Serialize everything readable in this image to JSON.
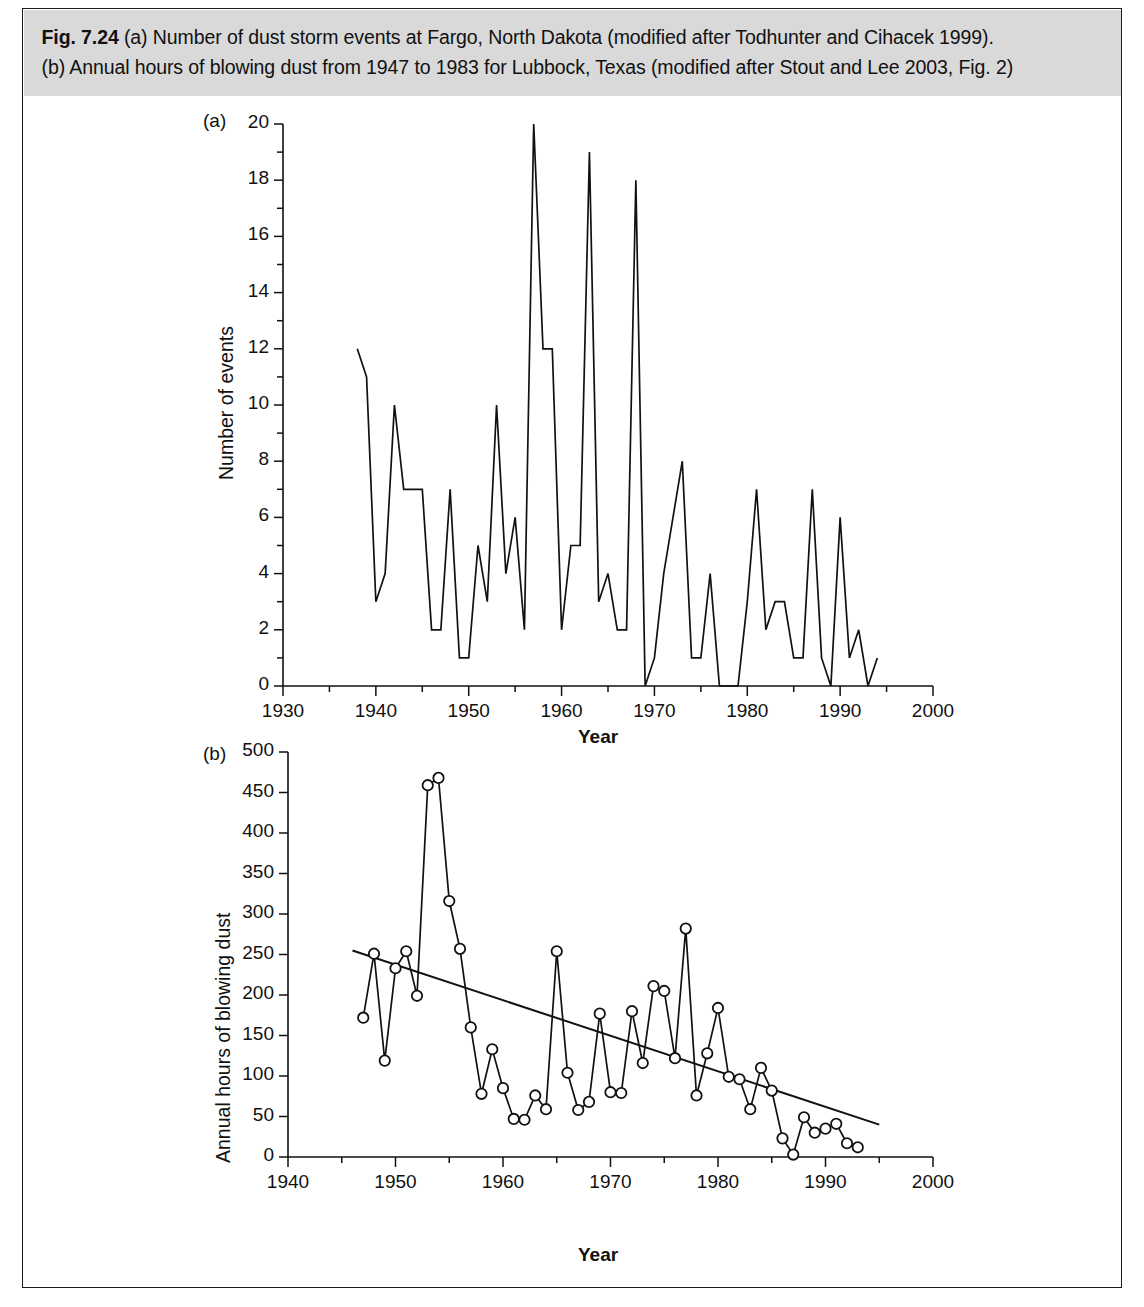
{
  "figure": {
    "label": "Fig. 7.24",
    "caption_line1": "(a) Number of dust storm events at Fargo, North Dakota (modified after Todhunter and Cihacek 1999).",
    "caption_line2": "(b) Annual hours of blowing dust from 1947 to 1983 for Lubbock, Texas (modified after Stout and Lee 2003, Fig. 2)",
    "background": "#d9d9d9",
    "ink": "#111111"
  },
  "panel_a": {
    "tag": "(a)",
    "xlabel": "Year",
    "ylabel": "Number of events",
    "x_ticklabels": [
      "1930",
      "1940",
      "1950",
      "1960",
      "1970",
      "1980",
      "1990",
      "2000"
    ],
    "y_ticklabels": [
      "0",
      "2",
      "4",
      "6",
      "8",
      "10",
      "12",
      "14",
      "16",
      "18",
      "20"
    ]
  },
  "panel_b": {
    "tag": "(b)",
    "xlabel": "Year",
    "ylabel": "Annual hours of blowing dust",
    "x_ticklabels": [
      "1940",
      "1950",
      "1960",
      "1970",
      "1980",
      "1990",
      "2000"
    ],
    "y_ticklabels": [
      "0",
      "50",
      "100",
      "150",
      "200",
      "250",
      "300",
      "350",
      "400",
      "450",
      "500"
    ]
  },
  "chart_data": [
    {
      "id": "panel-a",
      "type": "line",
      "title": "(a) Number of dust storm events at Fargo, North Dakota",
      "xlabel": "Year",
      "ylabel": "Number of events",
      "xlim": [
        1930,
        2000
      ],
      "ylim": [
        0,
        20
      ],
      "xticks": [
        1930,
        1940,
        1950,
        1960,
        1970,
        1980,
        1990,
        2000
      ],
      "xminorticks": [
        1935,
        1945,
        1955,
        1965,
        1975,
        1985,
        1995
      ],
      "yticks": [
        0,
        2,
        4,
        6,
        8,
        10,
        12,
        14,
        16,
        18,
        20
      ],
      "yminorticks": [
        1,
        3,
        5,
        7,
        9,
        11,
        13,
        15,
        17,
        19
      ],
      "grid": false,
      "legend": false,
      "markers": false,
      "x": [
        1938,
        1939,
        1940,
        1941,
        1942,
        1943,
        1944,
        1945,
        1946,
        1947,
        1948,
        1949,
        1950,
        1951,
        1952,
        1953,
        1954,
        1955,
        1956,
        1957,
        1958,
        1959,
        1960,
        1961,
        1962,
        1963,
        1964,
        1965,
        1966,
        1967,
        1968,
        1969,
        1970,
        1971,
        1972,
        1973,
        1974,
        1975,
        1976,
        1977,
        1978,
        1979,
        1980,
        1981,
        1982,
        1983,
        1984,
        1985,
        1986,
        1987,
        1988,
        1989,
        1990,
        1991,
        1992,
        1993,
        1994
      ],
      "y": [
        12,
        11,
        3,
        4,
        10,
        7,
        7,
        7,
        2,
        2,
        7,
        1,
        1,
        5,
        3,
        10,
        4,
        6,
        2,
        20,
        12,
        12,
        2,
        5,
        5,
        19,
        3,
        4,
        2,
        2,
        18,
        0,
        1,
        4,
        6,
        8,
        1,
        1,
        4,
        0,
        0,
        0,
        3,
        7,
        2,
        3,
        3,
        1,
        1,
        7,
        1,
        0,
        6,
        1,
        2,
        0,
        1
      ]
    },
    {
      "id": "panel-b",
      "type": "scatter",
      "title": "(b) Annual hours of blowing dust, Lubbock, Texas",
      "xlabel": "Year",
      "ylabel": "Annual hours of blowing dust",
      "xlim": [
        1940,
        2000
      ],
      "ylim": [
        0,
        500
      ],
      "xticks": [
        1940,
        1950,
        1960,
        1970,
        1980,
        1990,
        2000
      ],
      "xminorticks": [
        1945,
        1955,
        1965,
        1975,
        1985,
        1995
      ],
      "yticks": [
        0,
        50,
        100,
        150,
        200,
        250,
        300,
        350,
        400,
        450,
        500
      ],
      "grid": false,
      "legend": false,
      "markers": true,
      "marker_style": "open-circle",
      "connected": true,
      "x": [
        1947,
        1948,
        1949,
        1950,
        1951,
        1952,
        1953,
        1954,
        1955,
        1956,
        1957,
        1958,
        1959,
        1960,
        1961,
        1962,
        1963,
        1964,
        1965,
        1966,
        1967,
        1968,
        1969,
        1970,
        1971,
        1972,
        1973,
        1974,
        1975,
        1976,
        1977,
        1978,
        1979,
        1980,
        1981,
        1982,
        1983,
        1984,
        1985,
        1986,
        1987,
        1988,
        1989,
        1990,
        1991,
        1992,
        1993
      ],
      "y": [
        172,
        251,
        119,
        233,
        254,
        199,
        459,
        468,
        316,
        257,
        160,
        78,
        133,
        85,
        47,
        46,
        76,
        59,
        254,
        104,
        58,
        68,
        177,
        80,
        79,
        180,
        116,
        211,
        205,
        122,
        282,
        76,
        128,
        184,
        99,
        96,
        59,
        110,
        82,
        23,
        3,
        49,
        30,
        35,
        41,
        17,
        12
      ],
      "trendline": {
        "x": [
          1946.0,
          1995.0
        ],
        "y": [
          255,
          40
        ],
        "style": "solid"
      }
    }
  ]
}
